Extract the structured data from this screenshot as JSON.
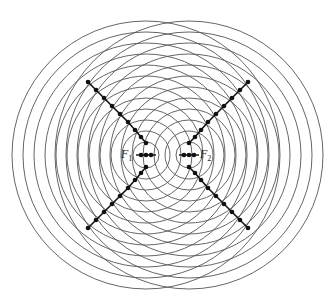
{
  "diagram": {
    "foci": [
      {
        "id": "F1",
        "label": "F",
        "subscript": "1",
        "cx": 146,
        "cy": 155
      },
      {
        "id": "F2",
        "label": "F",
        "subscript": "2",
        "cx": 189,
        "cy": 155
      }
    ],
    "wavefronts": {
      "radius_step": 11,
      "count": 12,
      "stroke": "#555555",
      "stroke_width": 0.9
    },
    "nodal_lines": {
      "color": "#111111",
      "dot_radius": 2.3,
      "lines": [
        {
          "name": "upper-left",
          "points": [
            [
              88,
              82
            ],
            [
              96,
              90
            ],
            [
              104,
              98
            ],
            [
              112,
              106
            ],
            [
              120,
              114
            ],
            [
              128,
              122
            ],
            [
              135,
              130
            ],
            [
              141,
              137
            ],
            [
              146,
              143
            ]
          ]
        },
        {
          "name": "lower-left",
          "points": [
            [
              88,
              228
            ],
            [
              96,
              220
            ],
            [
              104,
              212
            ],
            [
              112,
              204
            ],
            [
              120,
              196
            ],
            [
              128,
              188
            ],
            [
              135,
              180
            ],
            [
              141,
              173
            ],
            [
              146,
              167
            ]
          ]
        },
        {
          "name": "upper-right",
          "points": [
            [
              248,
              82
            ],
            [
              240,
              90
            ],
            [
              232,
              98
            ],
            [
              224,
              106
            ],
            [
              216,
              114
            ],
            [
              208,
              122
            ],
            [
              201,
              130
            ],
            [
              195,
              137
            ],
            [
              189,
              143
            ]
          ]
        },
        {
          "name": "lower-right",
          "points": [
            [
              248,
              228
            ],
            [
              240,
              220
            ],
            [
              232,
              212
            ],
            [
              224,
              204
            ],
            [
              216,
              196
            ],
            [
              208,
              188
            ],
            [
              201,
              180
            ],
            [
              195,
              173
            ],
            [
              189,
              167
            ]
          ]
        }
      ],
      "center_dots": [
        [
          141,
          155
        ],
        [
          146,
          155
        ],
        [
          151,
          155
        ],
        [
          184,
          155
        ],
        [
          189,
          155
        ],
        [
          194,
          155
        ]
      ]
    },
    "labels": {
      "f1_label": "F",
      "f1_sub": "1",
      "f2_label": "F",
      "f2_sub": "2"
    }
  }
}
